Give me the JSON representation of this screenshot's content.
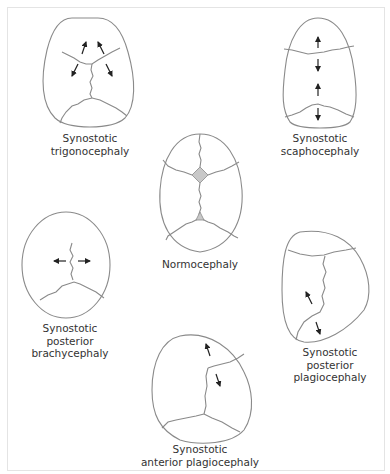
{
  "figure": {
    "panels": [
      {
        "id": "trigonocephaly",
        "label_lines": [
          "Synostotic",
          "trigonocephaly"
        ]
      },
      {
        "id": "scaphocephaly",
        "label_lines": [
          "Synostotic",
          "scaphocephaly"
        ]
      },
      {
        "id": "normocephaly",
        "label_lines": [
          "Normocephaly"
        ]
      },
      {
        "id": "posterior-brachycephaly",
        "label_lines": [
          "Synostotic",
          "posterior",
          "brachycephaly"
        ]
      },
      {
        "id": "posterior-plagiocephaly",
        "label_lines": [
          "Synostotic",
          "posterior",
          "plagiocephaly"
        ]
      },
      {
        "id": "anterior-plagiocephaly",
        "label_lines": [
          "Synostotic",
          "anterior plagiocephaly"
        ]
      }
    ],
    "colors": {
      "outline": "#8a8a8a",
      "suture": "#8a8a8a",
      "arrow": "#222222",
      "fontanelle_fill": "#c8c8c8",
      "border": "#e4e4e4"
    }
  }
}
